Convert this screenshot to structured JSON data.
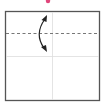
{
  "diagram": {
    "type": "origami-fold-step",
    "paper": {
      "shape": "square",
      "edge_color": "#555555",
      "fill": "#ffffff"
    },
    "crease_lines": [
      {
        "orientation": "vertical",
        "style": "thin-solid",
        "color": "#dddddd"
      },
      {
        "orientation": "horizontal",
        "style": "thin-solid",
        "color": "#dddddd"
      }
    ],
    "fold_line": {
      "orientation": "horizontal",
      "style": "valley-dashed",
      "color": "#777777"
    },
    "fold_arrow": {
      "type": "double-headed-curved",
      "color": "#222222"
    },
    "marker_dot": {
      "color": "#e0457b"
    }
  }
}
